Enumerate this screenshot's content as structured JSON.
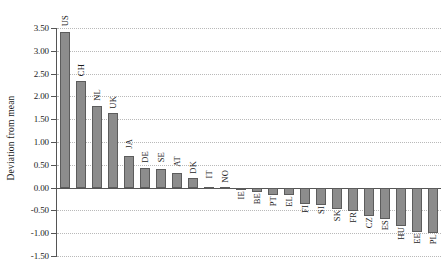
{
  "chart_data": {
    "type": "bar",
    "title": "",
    "subtitle": "",
    "xlabel": "",
    "ylabel": "Deviation from mean",
    "ylim": [
      -1.5,
      3.5
    ],
    "ytick_step": 0.5,
    "ytick_labels": [
      "3.50",
      "3.00",
      "2.50",
      "2.00",
      "1.50",
      "1.00",
      "0.50",
      "0.00",
      "-0.50",
      "-1.00",
      "-1.50"
    ],
    "ytick_values": [
      3.5,
      3.0,
      2.5,
      2.0,
      1.5,
      1.0,
      0.5,
      0.0,
      -0.5,
      -1.0,
      -1.5
    ],
    "grid": true,
    "grid_axis": "y",
    "legend": "none",
    "bar_color": "#8c8c8c",
    "bar_edge_color": "#5c5c5c",
    "categories": [
      "US",
      "CH",
      "NL",
      "UK",
      "JA",
      "DE",
      "SE",
      "AT",
      "DK",
      "IT",
      "NO",
      "IE",
      "BE",
      "PT",
      "EL",
      "FI",
      "SI",
      "SK",
      "FR",
      "CZ",
      "ES",
      "HU",
      "EE",
      "PL"
    ],
    "values": [
      3.42,
      2.33,
      1.79,
      1.64,
      0.7,
      0.42,
      0.4,
      0.33,
      0.2,
      0.01,
      0.01,
      -0.06,
      -0.09,
      -0.16,
      -0.17,
      -0.37,
      -0.38,
      -0.46,
      -0.52,
      -0.62,
      -0.68,
      -0.84,
      -0.97,
      -0.99
    ]
  }
}
